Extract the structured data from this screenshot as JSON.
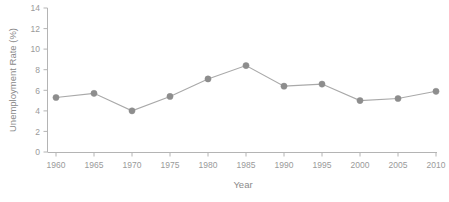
{
  "chart_data": {
    "type": "line",
    "title": "",
    "xlabel": "Year",
    "ylabel": "Unemployment Rate (%)",
    "x": [
      1960,
      1965,
      1970,
      1975,
      1980,
      1985,
      1990,
      1995,
      2000,
      2005,
      2010
    ],
    "values": [
      5.3,
      5.7,
      4.0,
      5.4,
      7.1,
      8.4,
      6.4,
      6.6,
      5.0,
      5.2,
      5.9
    ],
    "xticklabels": [
      "1960",
      "1965",
      "1970",
      "1975",
      "1980",
      "1985",
      "1990",
      "1995",
      "2000",
      "2005",
      "2010"
    ],
    "yticks": [
      0,
      2,
      4,
      6,
      8,
      10,
      12,
      14
    ],
    "yticklabels": [
      "0",
      "2",
      "4",
      "6",
      "8",
      "10",
      "12",
      "14"
    ],
    "xlim": [
      1960,
      2010
    ],
    "ylim": [
      0,
      14
    ],
    "grid": false,
    "legend": false,
    "series": [
      {
        "name": "Unemployment Rate",
        "values": [
          5.3,
          5.7,
          4.0,
          5.4,
          7.1,
          8.4,
          6.4,
          6.6,
          5.0,
          5.2,
          5.9
        ],
        "marker": "circle",
        "line_color": "#a9a9a9",
        "marker_color": "#8d8d8d"
      }
    ],
    "colors": {
      "line": "#a9a9a9",
      "marker": "#8d8d8d",
      "axis": "#b4b4b4",
      "tick_text": "#9a9a9a",
      "label_text": "#8a8a8a",
      "background": "#ffffff"
    }
  }
}
